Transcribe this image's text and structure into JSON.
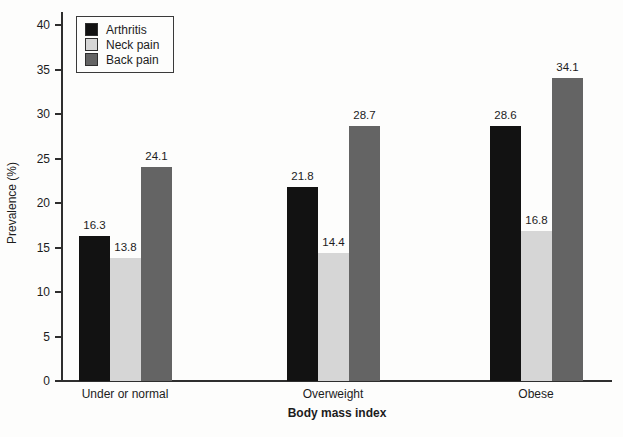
{
  "chart_data": {
    "type": "bar",
    "categories": [
      "Under or normal",
      "Overweight",
      "Obese"
    ],
    "series": [
      {
        "name": "Arthritis",
        "color": "#121212",
        "values": [
          16.3,
          21.8,
          28.6
        ]
      },
      {
        "name": "Neck pain",
        "color": "#d6d6d6",
        "values": [
          13.8,
          14.4,
          16.8
        ]
      },
      {
        "name": "Back pain",
        "color": "#646464",
        "values": [
          24.1,
          28.7,
          34.1
        ]
      }
    ],
    "title": "",
    "xlabel": "Body mass index",
    "ylabel": "Prevalence (%)",
    "ylim": [
      0,
      40
    ],
    "ytick_step": 5,
    "ytick_labels": [
      "0",
      "5",
      "10",
      "15",
      "20",
      "25",
      "30",
      "35",
      "40"
    ],
    "grid": false,
    "legend_position": "upper-left",
    "value_labels": true,
    "value_label_format": "one-decimal"
  }
}
